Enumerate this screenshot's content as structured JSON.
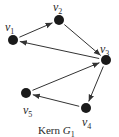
{
  "graph": {
    "caption": {
      "prefix": "Kern ",
      "name": "G",
      "subscript": "1"
    },
    "nodes": [
      {
        "id": "v1",
        "label": "v",
        "sub": "1"
      },
      {
        "id": "v2",
        "label": "v",
        "sub": "2"
      },
      {
        "id": "v3",
        "label": "v",
        "sub": "3"
      },
      {
        "id": "v4",
        "label": "v",
        "sub": "4"
      },
      {
        "id": "v5",
        "label": "v",
        "sub": "5"
      }
    ],
    "edges": [
      {
        "from": "v1",
        "to": "v2"
      },
      {
        "from": "v2",
        "to": "v3"
      },
      {
        "from": "v3",
        "to": "v1"
      },
      {
        "from": "v3",
        "to": "v4"
      },
      {
        "from": "v4",
        "to": "v5"
      },
      {
        "from": "v5",
        "to": "v3"
      }
    ],
    "colors": {
      "node": "#1a1a1a",
      "edge": "#333333"
    }
  }
}
